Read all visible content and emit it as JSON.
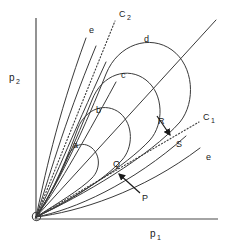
{
  "figure": {
    "width": 233,
    "height": 251,
    "background_color": "#ffffff",
    "line_color": "#3a3a3a",
    "axis_color": "#4a4a4a",
    "label_color": "#1a1a1a"
  },
  "axes": {
    "x": {
      "label_main": "p",
      "label_sub": "1",
      "label_x": 152,
      "label_y": 236,
      "start": [
        35,
        219
      ],
      "end": [
        218,
        219
      ]
    },
    "y": {
      "label_main": "p",
      "label_sub": "2",
      "label_x": 10,
      "label_y": 81,
      "start": [
        36,
        18
      ],
      "end": [
        36,
        219
      ]
    },
    "origin": [
      35,
      218
    ]
  },
  "labels": {
    "curve_a": "a",
    "curve_b": "b",
    "curve_c": "c",
    "curve_d": "d",
    "curve_e_upper": "e",
    "curve_e_lower": "e",
    "point_p": "P",
    "point_q": "Q",
    "point_r": "R",
    "point_s": "S",
    "line_c1_main": "C",
    "line_c1_sub": "1",
    "line_c2_main": "C",
    "line_c2_sub": "2"
  },
  "label_positions": {
    "curve_a": [
      73,
      148
    ],
    "curve_b": [
      96,
      113
    ],
    "curve_c": [
      121,
      78
    ],
    "curve_d": [
      144,
      42
    ],
    "curve_e_upper": [
      89,
      33
    ],
    "curve_e_lower": [
      206,
      160
    ],
    "point_p": [
      142,
      198
    ],
    "point_q": [
      114,
      166
    ],
    "point_r": [
      160,
      123
    ],
    "point_s": [
      177,
      144
    ],
    "line_c1": [
      205,
      119
    ],
    "line_c2": [
      122,
      16
    ]
  },
  "geometry": {
    "fan_curves_count": 9,
    "closed_contours": [
      "a",
      "b",
      "c",
      "d"
    ],
    "open_curves": [
      "e-upper",
      "e-lower"
    ],
    "diagonal_line": {
      "start": [
        35,
        218
      ],
      "end": [
        216,
        20
      ]
    },
    "dotted_c1": {
      "start": [
        35,
        218
      ],
      "end": [
        196,
        124
      ]
    },
    "dotted_c2": {
      "start": [
        35,
        218
      ],
      "end": [
        114,
        22
      ]
    },
    "arrow_p_to_q": {
      "from": [
        139,
        191
      ],
      "to": [
        117,
        172
      ]
    },
    "arrow_r_to_s": {
      "from": [
        158,
        117
      ],
      "to": [
        172,
        137
      ]
    }
  }
}
